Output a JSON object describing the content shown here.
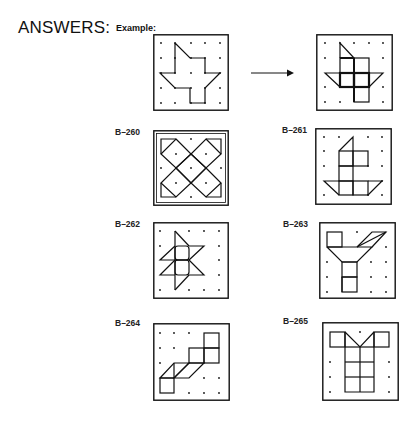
{
  "heading": "ANSWERS:",
  "example_label": "Example:",
  "arrow_icon": "right-arrow-icon",
  "colors": {
    "ink": "#111111",
    "background": "#ffffff"
  },
  "grid": {
    "dots_per_side": 5
  },
  "panels": [
    {
      "id": "example-before",
      "label": "",
      "x": 153,
      "y": 34,
      "size": 76
    },
    {
      "id": "example-after",
      "label": "",
      "x": 316,
      "y": 34,
      "size": 76
    },
    {
      "id": "B-260",
      "label": "B–260",
      "label_x": 115,
      "label_y": 127,
      "x": 153,
      "y": 130,
      "size": 76
    },
    {
      "id": "B-261",
      "label": "B–261",
      "label_x": 282,
      "label_y": 125,
      "x": 315,
      "y": 128,
      "size": 77
    },
    {
      "id": "B-262",
      "label": "B–262",
      "label_x": 115,
      "label_y": 219,
      "x": 153,
      "y": 222,
      "size": 76
    },
    {
      "id": "B-263",
      "label": "B–263",
      "label_x": 283,
      "label_y": 219,
      "x": 319,
      "y": 222,
      "size": 77
    },
    {
      "id": "B-264",
      "label": "B–264",
      "label_x": 115,
      "label_y": 318,
      "x": 153,
      "y": 323,
      "size": 77
    },
    {
      "id": "B-265",
      "label": "B–265",
      "label_x": 283,
      "label_y": 316,
      "x": 322,
      "y": 322,
      "size": 77
    }
  ]
}
